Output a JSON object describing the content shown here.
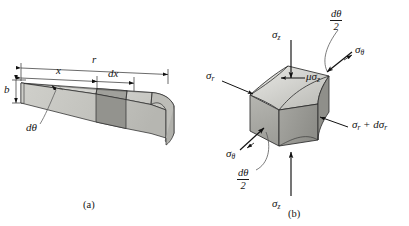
{
  "figure": {
    "panel_a": {
      "caption": "(a)",
      "dim_r": "r",
      "dim_x": "x",
      "dim_dx": "dx",
      "dim_b": "b",
      "angle_label": "dθ",
      "colors": {
        "face_top_light": "#d8d8d4",
        "face_top_mid": "#cfcfca",
        "face_front": "#c4c4bf",
        "slice_dark": "#9a9a96",
        "slice_front_dark": "#8e8e8a",
        "outline": "#2b2b2b"
      }
    },
    "panel_b": {
      "caption": "(b)",
      "stress_sigma_z_top": {
        "sym": "σ",
        "sub": "z"
      },
      "stress_sigma_z_bottom": {
        "sym": "σ",
        "sub": "z"
      },
      "stress_sigma_r_left": {
        "sym": "σ",
        "sub": "r"
      },
      "stress_sigma_r_plus": {
        "sym": "σ",
        "sub": "r",
        "tail": " + dσ",
        "tail_sub": "r"
      },
      "stress_sigma_theta_upper": {
        "sym": "σ",
        "sub": "θ"
      },
      "stress_sigma_theta_lower": {
        "sym": "σ",
        "sub": "θ"
      },
      "stress_mu_sigma_z": {
        "sym": "μσ",
        "sub": "z"
      },
      "half_angle_upper": {
        "num": "dθ",
        "den": "2"
      },
      "half_angle_lower": {
        "num": "dθ",
        "den": "2"
      },
      "colors": {
        "face_top": "#dadad6",
        "face_top_shade": "#c9c9c4",
        "face_front": "#a8a8a3",
        "face_right": "#9b9b96",
        "face_curve_dark": "#8f8f8a",
        "outline": "#2b2b2b",
        "arrow": "#111111",
        "leader": "#4a4a4a"
      }
    },
    "background": "#ffffff"
  }
}
